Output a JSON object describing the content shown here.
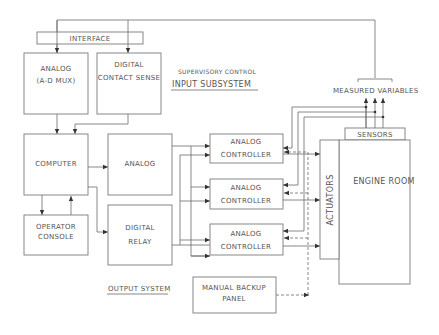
{
  "diagram": {
    "blocks": {
      "interface": "INTERFACE",
      "analog_mux_line1": "ANALOG",
      "analog_mux_line2": "(A-D MUX)",
      "digital_sense_line1": "DIGITAL",
      "digital_sense_line2": "CONTACT SENSE",
      "computer": "COMPUTER",
      "analog_out": "ANALOG",
      "operator_line1": "OPERATOR",
      "operator_line2": "CONSOLE",
      "digital_relay_line1": "DIGITAL",
      "digital_relay_line2": "RELAY",
      "controller_line1": "ANALOG",
      "controller_line2": "CONTROLLER",
      "manual_line1": "MANUAL BACKUP",
      "manual_line2": "PANEL",
      "sensors": "SENSORS",
      "actuators": "ACTUATORS",
      "engine_room": "ENGINE ROOM"
    },
    "labels": {
      "supervisory": "SUPERVISORY CONTROL",
      "input_subsystem": "INPUT SUBSYSTEM",
      "output_system": "OUTPUT SYSTEM",
      "measured_variables": "MEASURED VARIABLES"
    },
    "colors": {
      "line": "#6a6a6a",
      "text": "#555555",
      "background": "#ffffff"
    }
  }
}
